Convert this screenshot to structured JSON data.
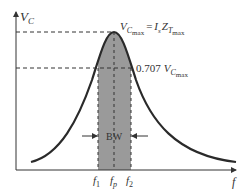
{
  "diagram": {
    "type": "resonance-curve",
    "y_axis_label": "V",
    "y_axis_sub": "C",
    "x_axis_label": "f",
    "peak_label": {
      "lhs_main": "V",
      "lhs_sub": "C",
      "lhs_subsub": "max",
      "equals": "=",
      "rhs_I": "I",
      "rhs_I_sub": "s",
      "rhs_Z": "Z",
      "rhs_Z_sub": "T",
      "rhs_Z_subsub": "max"
    },
    "half_power_label": {
      "coefficient": "0.707",
      "main": "V",
      "sub": "C",
      "subsub": "max"
    },
    "bandwidth_label": "BW",
    "frequency_ticks": [
      {
        "main": "f",
        "sub": "1"
      },
      {
        "main": "f",
        "sub": "p"
      },
      {
        "main": "f",
        "sub": "2"
      }
    ],
    "colors": {
      "curve": "#2a2a2a",
      "shade": "#9a9a9a",
      "axes": "#333333",
      "dashes": "#333333"
    }
  }
}
